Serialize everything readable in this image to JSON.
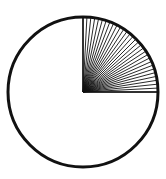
{
  "diagram": {
    "type": "circle-with-shaded-quadrant",
    "center": [
      83,
      92
    ],
    "radius": 75,
    "ray_count": 30,
    "stroke_color": "#111111",
    "background_color": "#ffffff",
    "shaded_fraction": 0.25
  }
}
